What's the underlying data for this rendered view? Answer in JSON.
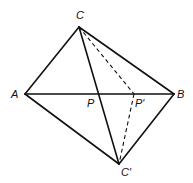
{
  "diagram": {
    "points": {
      "A": {
        "label": "A",
        "x": 25,
        "y": 94
      },
      "B": {
        "label": "B",
        "x": 174,
        "y": 94
      },
      "C": {
        "label": "C",
        "x": 79,
        "y": 27
      },
      "Cp": {
        "label": "C′",
        "x": 119,
        "y": 164
      },
      "P": {
        "label": "P",
        "x": 97,
        "y": 94
      },
      "Pp": {
        "label": "P′",
        "x": 134,
        "y": 94
      }
    },
    "solid_edges": [
      "AC",
      "CB",
      "AB",
      "AC′",
      "C′B",
      "CC′"
    ],
    "dashed_edges": [
      "CP′",
      "P′C′"
    ],
    "colors": {
      "line": "#111111",
      "background": "#ffffff"
    }
  }
}
